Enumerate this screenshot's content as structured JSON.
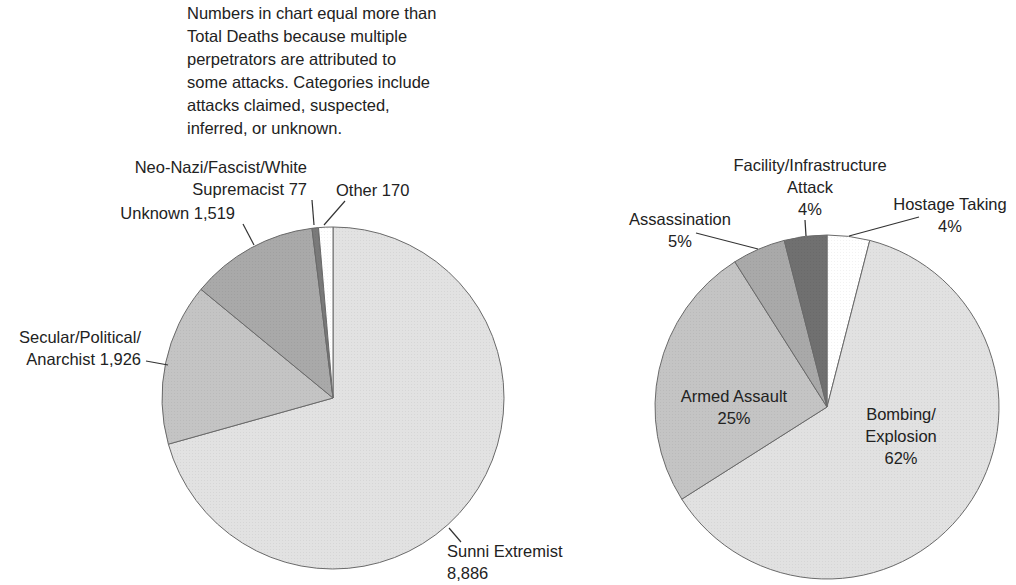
{
  "note": {
    "lines": [
      "Numbers in chart equal more than",
      "Total Deaths because multiple",
      "perpetrators are attributed to",
      "some attacks. Categories include",
      "attacks claimed, suspected,",
      "inferred, or unknown."
    ]
  },
  "chart_data": [
    {
      "type": "pie",
      "title": "",
      "start_angle": "top, clockwise",
      "categories": [
        "Sunni Extremist",
        "Secular/Political/Anarchist",
        "Unknown",
        "Neo-Nazi/Fascist/White Supremacist",
        "Other"
      ],
      "values": [
        8886,
        1926,
        1519,
        77,
        170
      ],
      "colors": [
        "#e2e2e2",
        "#c4c4c4",
        "#a9a9a9",
        "#7a7a7a",
        "#ffffff"
      ],
      "labels": [
        {
          "lines": [
            "Sunni Extremist",
            "8,886"
          ],
          "x": 447,
          "y": 557,
          "anchor": "start",
          "leader": [
            [
              449,
              528
            ],
            [
              461,
              542
            ]
          ]
        },
        {
          "lines": [
            "Secular/Political/",
            "Anarchist 1,926"
          ],
          "x": 141,
          "y": 343,
          "anchor": "end",
          "leader": [
            [
              146,
              361
            ],
            [
              168,
              365
            ]
          ]
        },
        {
          "lines": [
            "Unknown 1,519"
          ],
          "x": 235,
          "y": 219,
          "anchor": "end",
          "leader": [
            [
              243,
              224
            ],
            [
              254,
              245
            ]
          ]
        },
        {
          "lines": [
            "Neo-Nazi/Fascist/White",
            "Supremacist 77"
          ],
          "x": 307,
          "y": 173,
          "anchor": "end",
          "leader": [
            [
              312,
              200
            ],
            [
              314,
              225
            ]
          ]
        },
        {
          "lines": [
            "Other 170"
          ],
          "x": 336,
          "y": 196,
          "anchor": "start",
          "leader": [
            [
              345,
              201
            ],
            [
              324,
              225
            ]
          ]
        }
      ],
      "center": [
        333,
        398
      ],
      "radius": 171
    },
    {
      "type": "pie",
      "title": "",
      "start_angle": "top, clockwise",
      "categories": [
        "Hostage Taking",
        "Bombing/Explosion",
        "Armed Assault",
        "Assassination",
        "Facility/Infrastructure Attack"
      ],
      "values": [
        4,
        62,
        25,
        5,
        4
      ],
      "unit": "%",
      "colors": [
        "#ffffff",
        "#e1e1e1",
        "#c4c4c4",
        "#a9a9a9",
        "#707070"
      ],
      "labels": [
        {
          "lines": [
            "Hostage Taking",
            "4%"
          ],
          "x": 950,
          "y": 210,
          "anchor": "middle",
          "leader": [
            [
              919,
              217
            ],
            [
              849,
              236
            ]
          ]
        },
        {
          "lines": [
            "Bombing/",
            "Explosion",
            "62%"
          ],
          "x": 901,
          "y": 420,
          "anchor": "middle",
          "leader": null
        },
        {
          "lines": [
            "Armed Assault",
            "25%"
          ],
          "x": 734,
          "y": 402,
          "anchor": "middle",
          "leader": null
        },
        {
          "lines": [
            "Assassination",
            "5%"
          ],
          "x": 680,
          "y": 225,
          "anchor": "middle",
          "leader": [
            [
              696,
              233
            ],
            [
              758,
              249
            ]
          ]
        },
        {
          "lines": [
            "Facility/Infrastructure",
            "Attack",
            "4%"
          ],
          "x": 810,
          "y": 171,
          "anchor": "middle",
          "leader": [
            [
              805,
              220
            ],
            [
              806,
              236
            ]
          ]
        }
      ],
      "center": [
        827,
        407
      ],
      "radius": 172
    }
  ]
}
